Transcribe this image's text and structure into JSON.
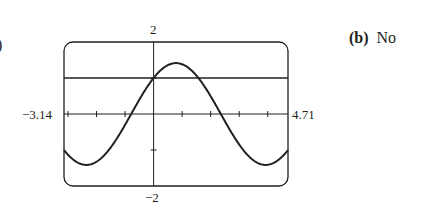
{
  "labels": {
    "part_a": ")",
    "part_b_letter": "(b)",
    "part_b_answer": "No"
  },
  "axes": {
    "xmin_label": "−3.14",
    "xmax_label": "4.71",
    "ymax_label": "2",
    "ymin_label": "−2"
  },
  "chart_data": {
    "type": "line",
    "title": "",
    "xlabel": "",
    "ylabel": "",
    "xlim": [
      -3.14,
      4.71
    ],
    "ylim": [
      -2,
      2
    ],
    "x_ticks_step": 1,
    "y_ticks_step": 1,
    "grid": false,
    "series": [
      {
        "name": "y = sin x + cos x",
        "x": [
          -3.14,
          -2.36,
          -1.57,
          -0.785,
          0,
          0.785,
          1.57,
          2.36,
          3.14,
          3.93,
          4.71
        ],
        "values": [
          -1.0,
          -1.41,
          -1.0,
          0.0,
          1.0,
          1.41,
          1.0,
          0.0,
          -1.0,
          -1.41,
          -1.0
        ]
      },
      {
        "name": "y = 1",
        "x": [
          -3.14,
          4.71
        ],
        "values": [
          1,
          1
        ]
      }
    ],
    "annotations": [
      "(b) No"
    ]
  },
  "colors": {
    "ink": "#231f20",
    "background": "#ffffff"
  }
}
